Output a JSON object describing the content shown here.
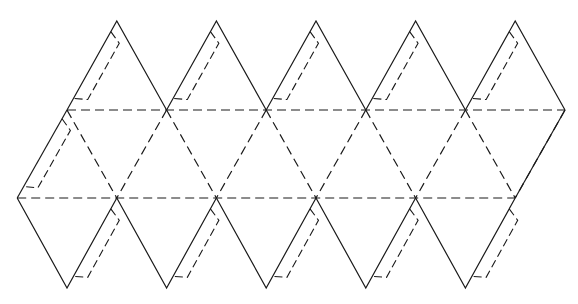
{
  "figure": {
    "faces": 20,
    "top_triangles": 5,
    "bottom_triangles": 5,
    "middle_band_triangles": 10,
    "flaps": 11,
    "line_styles": {
      "cut_edges": "solid",
      "fold_lines": "dashed",
      "glue_flaps": "dashed"
    },
    "stroke_color": "#1a1a1a",
    "background_color": "#ffffff",
    "caption_visible": false
  }
}
